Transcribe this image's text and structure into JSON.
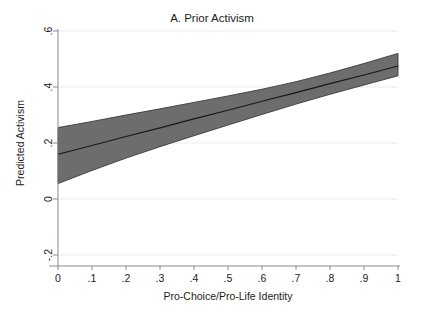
{
  "chart_data": {
    "type": "area",
    "title": "A. Prior Activism",
    "xlabel": "Pro-Choice/Pro-Life Identity",
    "ylabel": "Predicted Activism",
    "xlim": [
      0,
      1
    ],
    "ylim": [
      -0.2,
      0.6
    ],
    "grid": true,
    "legend": null,
    "xticks": [
      0,
      0.1,
      0.2,
      0.3,
      0.4,
      0.5,
      0.6,
      0.7,
      0.8,
      0.9,
      1
    ],
    "xticklabels": [
      "0",
      ".1",
      ".2",
      ".3",
      ".4",
      ".5",
      ".6",
      ".7",
      ".8",
      ".9",
      "1"
    ],
    "yticks": [
      -0.2,
      0,
      0.2,
      0.4,
      0.6
    ],
    "yticklabels": [
      "-.2",
      "0",
      ".2",
      ".4",
      ".6"
    ],
    "x": [
      0,
      0.1,
      0.2,
      0.3,
      0.4,
      0.5,
      0.6,
      0.7,
      0.8,
      0.9,
      1
    ],
    "series": [
      {
        "name": "Predicted Activism",
        "values": [
          0.16,
          0.191,
          0.223,
          0.254,
          0.286,
          0.317,
          0.349,
          0.38,
          0.412,
          0.443,
          0.475
        ]
      },
      {
        "name": "95% CI upper",
        "values": [
          0.255,
          0.277,
          0.3,
          0.322,
          0.345,
          0.368,
          0.392,
          0.419,
          0.45,
          0.484,
          0.52
        ]
      },
      {
        "name": "95% CI lower",
        "values": [
          0.055,
          0.102,
          0.146,
          0.187,
          0.226,
          0.264,
          0.302,
          0.339,
          0.374,
          0.407,
          0.44
        ]
      }
    ],
    "colors": {
      "band_fill": "#6d6d6d",
      "band_edge": "#3a3a3a",
      "fit_line": "#17171a",
      "grid": "#ececed",
      "axis": "#8a8a8a",
      "text": "#1c1c1c",
      "background": "#ffffff"
    }
  }
}
